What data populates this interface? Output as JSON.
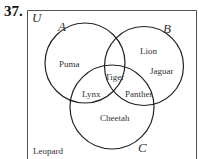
{
  "problem": {
    "number": "37."
  },
  "universe": {
    "label": "U",
    "outside_elements": [
      "Leopard"
    ]
  },
  "sets": {
    "A": {
      "label": "A"
    },
    "B": {
      "label": "B"
    },
    "C": {
      "label": "C"
    }
  },
  "regions": {
    "A_only": "Puma",
    "B_only_1": "Lion",
    "B_only_2": "Jaguar",
    "A_and_B_and_C": "Tiger",
    "A_and_C_only": "Lynx",
    "B_and_C_only": "Panther",
    "C_only": "Cheetah",
    "outside": "Leopard"
  },
  "colors": {
    "line": "#222222",
    "frame": "#555555",
    "text": "#333333"
  }
}
